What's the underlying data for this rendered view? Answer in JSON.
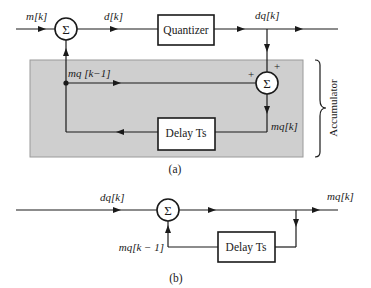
{
  "diagram_a": {
    "input_label": "m[k]",
    "error_label": "d[k]",
    "quantizer_label": "Quantizer",
    "quantized_label": "dq[k]",
    "feedback_label": "mq [k−1]",
    "output_label": "mq[k]",
    "delay_label": "Delay Ts",
    "sum_symbol": "Σ",
    "plus_left": "+",
    "plus_top": "+",
    "accumulator_label": "Accumulator",
    "caption": "(a)",
    "background_color": "#cfcfcf"
  },
  "diagram_b": {
    "input_label": "dq[k]",
    "output_label": "mq[k]",
    "feedback_label": "mq[k − 1]",
    "delay_label": "Delay Ts",
    "sum_symbol": "Σ",
    "caption": "(b)"
  }
}
